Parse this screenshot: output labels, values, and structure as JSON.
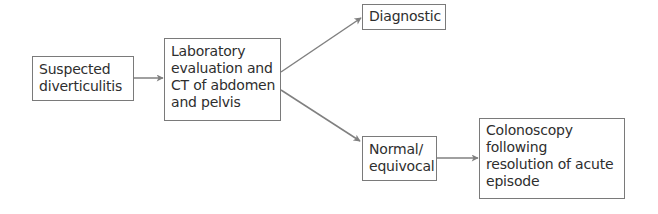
{
  "diagram": {
    "type": "flowchart",
    "colors": {
      "text": "#2e2e2e",
      "border": "#7a7a7a",
      "arrow": "#808080",
      "background": "#ffffff"
    },
    "nodes": [
      {
        "id": "suspected",
        "lines": [
          "Suspected",
          "diverticulitis"
        ]
      },
      {
        "id": "lab_ct",
        "lines": [
          "Laboratory",
          "evaluation and",
          "CT of abdomen",
          "and pelvis"
        ]
      },
      {
        "id": "diagnostic",
        "lines": [
          "Diagnostic"
        ]
      },
      {
        "id": "normal",
        "lines": [
          "Normal/",
          "equivocal"
        ]
      },
      {
        "id": "colonoscopy",
        "lines": [
          "Colonoscopy",
          "following",
          "resolution of acute",
          "episode"
        ]
      }
    ],
    "edges": [
      {
        "from": "suspected",
        "to": "lab_ct"
      },
      {
        "from": "lab_ct",
        "to": "diagnostic"
      },
      {
        "from": "lab_ct",
        "to": "normal"
      },
      {
        "from": "normal",
        "to": "colonoscopy"
      }
    ]
  }
}
